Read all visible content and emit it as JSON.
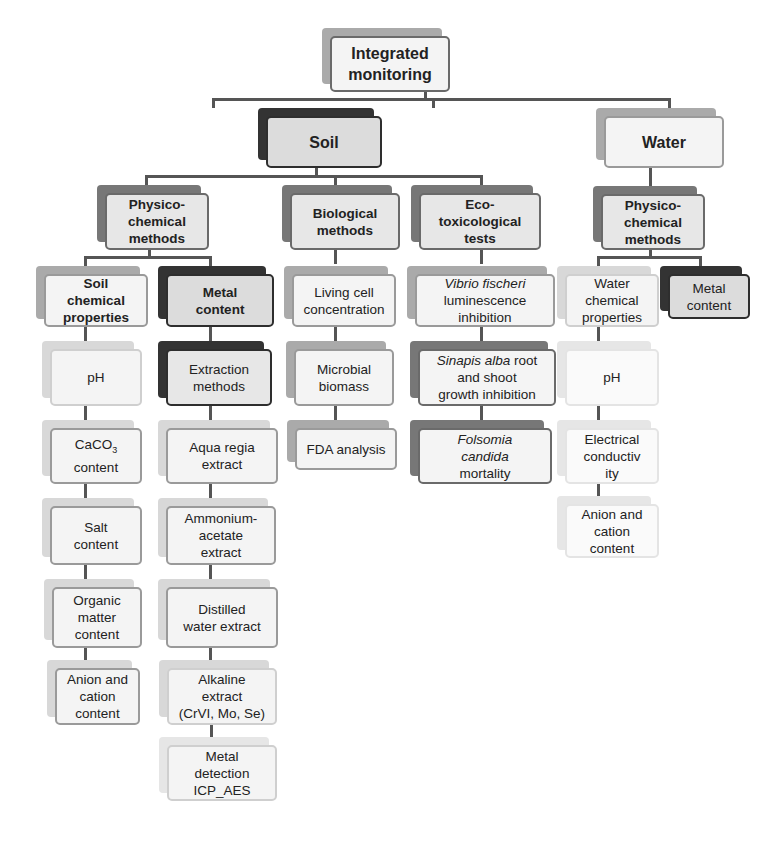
{
  "diagram": {
    "root": {
      "label": [
        "Integrated",
        "monitoring"
      ]
    },
    "soil": {
      "label": "Soil",
      "physico": {
        "label": [
          "Physico-",
          "chemical",
          "methods"
        ],
        "soil_chemical": {
          "label": [
            "Soil",
            "chemical",
            "properties"
          ],
          "items": [
            {
              "label": [
                "pH"
              ]
            },
            {
              "label": [
                "CaCO",
                "content"
              ],
              "sub": "3"
            },
            {
              "label": [
                "Salt",
                "content"
              ]
            },
            {
              "label": [
                "Organic",
                "matter",
                "content"
              ]
            },
            {
              "label": [
                "Anion and",
                "cation",
                "content"
              ]
            }
          ]
        },
        "metal": {
          "label": [
            "Metal",
            "content"
          ],
          "items": [
            {
              "label": [
                "Extraction",
                "methods"
              ]
            },
            {
              "label": [
                "Aqua regia",
                "extract"
              ]
            },
            {
              "label": [
                "Ammonium-",
                "acetate",
                "extract"
              ]
            },
            {
              "label": [
                "Distilled",
                "water extract"
              ]
            },
            {
              "label": [
                "Alkaline",
                "extract",
                "(CrVI, Mo, Se)"
              ]
            },
            {
              "label": [
                "Metal",
                "detection",
                "ICP_AES"
              ]
            }
          ]
        }
      },
      "biological": {
        "label": [
          "Biological",
          "methods"
        ],
        "items": [
          {
            "label": [
              "Living cell",
              "concentration"
            ]
          },
          {
            "label": [
              "Microbial",
              "biomass"
            ]
          },
          {
            "label": [
              "FDA analysis"
            ]
          }
        ]
      },
      "ecotox": {
        "label": [
          "Eco-",
          "toxicological",
          "tests"
        ],
        "items": [
          {
            "italic": "Vibrio fischeri",
            "label": [
              "luminescence",
              "inhibition"
            ]
          },
          {
            "italic": "Sinapis alba",
            "tail": " root",
            "label": [
              "and shoot",
              "growth inhibition"
            ]
          },
          {
            "italic_lines": [
              "Folsomia",
              "candida"
            ],
            "label": [
              "mortality"
            ]
          }
        ]
      }
    },
    "water": {
      "label": "Water",
      "physico": {
        "label": [
          "Physico-",
          "chemical",
          "methods"
        ],
        "water_chemical": {
          "label": [
            "Water",
            "chemical",
            "properties"
          ],
          "items": [
            {
              "label": [
                "pH"
              ]
            },
            {
              "label": [
                "Electrical",
                "conductiv",
                "ity"
              ]
            },
            {
              "label": [
                "Anion and",
                "cation",
                "content"
              ]
            }
          ]
        },
        "metal": {
          "label": [
            "Metal",
            "content"
          ]
        }
      }
    }
  }
}
